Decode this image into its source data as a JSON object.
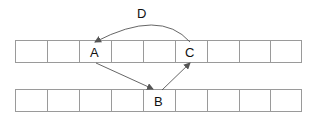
{
  "diagram": {
    "rows": [
      {
        "name": "array-top",
        "cells": 9,
        "labels": {
          "2": "A",
          "5": "C"
        }
      },
      {
        "name": "array-bottom",
        "cells": 9,
        "labels": {
          "4": "B"
        }
      }
    ],
    "nodes": {
      "A": "A",
      "B": "B",
      "C": "C",
      "D": "D"
    },
    "edges": [
      {
        "from": "A",
        "to": "B",
        "label": ""
      },
      {
        "from": "B",
        "to": "C",
        "label": ""
      },
      {
        "from": "C",
        "to": "A",
        "label": "D"
      }
    ],
    "colors": {
      "grid": "#9a9a9a",
      "edge": "#555555",
      "text": "#111111"
    }
  }
}
